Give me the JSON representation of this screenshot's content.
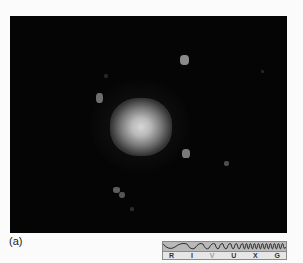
{
  "figure": {
    "label": "(a)",
    "image_description": "Astronomical visible-light image of a fuzzy, roughly circular bright core on a black background with several small faint point sources nearby",
    "colors": {
      "background": "#fbfbfb",
      "photo_background": "#050505",
      "core": "#d6d6d6",
      "spectrum_wave_band": "#b9b9b9",
      "spectrum_letter_band": "#e6e6e6"
    }
  },
  "spectrum_bar": {
    "bands": [
      {
        "letter": "R",
        "name": "radio",
        "active": false
      },
      {
        "letter": "I",
        "name": "infrared",
        "active": false
      },
      {
        "letter": "V",
        "name": "visible",
        "active": true
      },
      {
        "letter": "U",
        "name": "ultraviolet",
        "active": false
      },
      {
        "letter": "X",
        "name": "x-ray",
        "active": false
      },
      {
        "letter": "G",
        "name": "gamma-ray",
        "active": false
      }
    ]
  }
}
